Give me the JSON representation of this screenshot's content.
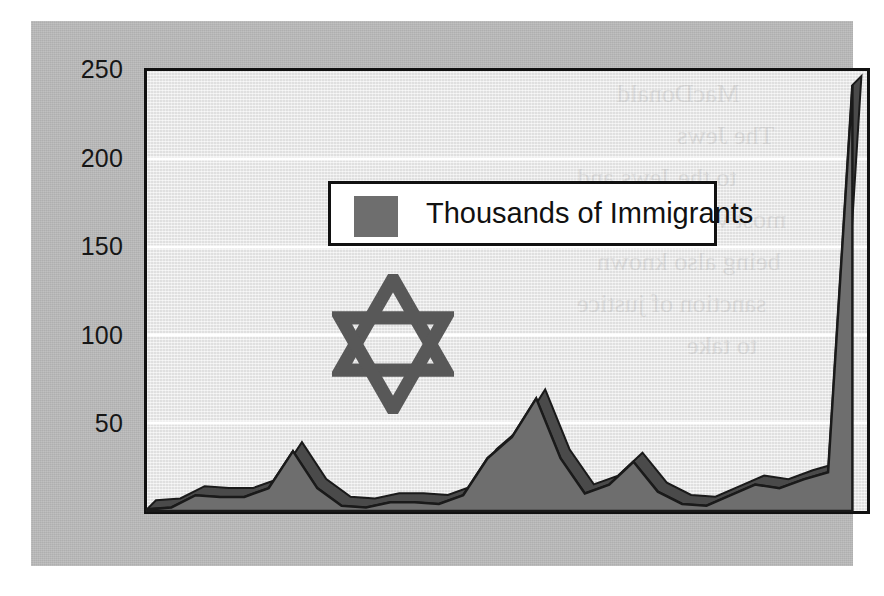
{
  "figure": {
    "background_color": "#ffffff",
    "panel_color": "#b9b9b9",
    "plot_background_color": "#e9e9e9",
    "axis_color": "#111111",
    "emblem": "star-of-david"
  },
  "legend": {
    "label": "Thousands of Immigrants",
    "swatch_color": "#6e6e6e",
    "position": "inside-top-left"
  },
  "axes": {
    "y_ticks": [
      "250",
      "200",
      "150",
      "100",
      "50"
    ],
    "x_ticks": [
      "1920",
      "1925",
      "1930",
      "1935",
      "1940",
      "1948"
    ]
  },
  "chart_data": {
    "type": "area",
    "title": "",
    "subtitle": "",
    "xlabel": "",
    "ylabel": "",
    "legend": [
      "Thousands of Immigrants"
    ],
    "legend_position": "inside-top-left",
    "grid": true,
    "gridlines_y": [
      50,
      100,
      150,
      200
    ],
    "xlim": [
      1919,
      1948.6
    ],
    "ylim": [
      0,
      250
    ],
    "y_ticks": [
      50,
      100,
      150,
      200,
      250
    ],
    "x_ticks": [
      1920,
      1925,
      1930,
      1935,
      1940,
      1948
    ],
    "series": [
      {
        "name": "Thousands of Immigrants",
        "color": "#6e6e6e",
        "shade_color": "#4a4a4a",
        "x": [
          1919,
          1920,
          1921,
          1922,
          1923,
          1924,
          1925,
          1926,
          1927,
          1928,
          1929,
          1930,
          1931,
          1932,
          1933,
          1934,
          1935,
          1936,
          1937,
          1938,
          1939,
          1940,
          1941,
          1942,
          1943,
          1944,
          1945,
          1946,
          1947,
          1948
        ],
        "values": [
          1,
          2,
          9,
          8,
          8,
          13,
          34,
          13,
          3,
          2,
          5,
          5,
          4,
          9,
          30,
          42,
          64,
          30,
          10,
          15,
          28,
          11,
          4,
          3,
          9,
          15,
          13,
          18,
          22,
          242
        ]
      }
    ],
    "annotations": [
      {
        "kind": "emblem",
        "name": "star-of-david",
        "x": 1922.6,
        "y": 130
      },
      {
        "kind": "peak",
        "label": "1925 peak",
        "x": 1925,
        "y": 34
      },
      {
        "kind": "peak",
        "label": "1935 peak",
        "x": 1935,
        "y": 64
      },
      {
        "kind": "peak",
        "label": "1948 spike",
        "x": 1948,
        "y": 242
      }
    ]
  },
  "y_label_positions": [
    {
      "text": "250",
      "top": 34
    },
    {
      "text": "200",
      "top": 123
    },
    {
      "text": "150",
      "top": 211
    },
    {
      "text": "100",
      "top": 300
    },
    {
      "text": "50",
      "top": 388
    }
  ],
  "x_label_positions": [
    {
      "text": "1920",
      "left": 106
    },
    {
      "text": "1925",
      "left": 228
    },
    {
      "text": "1930",
      "left": 350
    },
    {
      "text": "1935",
      "left": 472
    },
    {
      "text": "1940",
      "left": 594
    },
    {
      "text": "1948",
      "left": 777
    }
  ],
  "bleed_text": [
    {
      "text": "MacDonald",
      "left": 470,
      "top": 8
    },
    {
      "text": "The Jews",
      "left": 530,
      "top": 50
    },
    {
      "text": "to the Jews and",
      "left": 430,
      "top": 92
    },
    {
      "text": "most violent action",
      "left": 440,
      "top": 134
    },
    {
      "text": "being also known",
      "left": 450,
      "top": 176
    },
    {
      "text": "sanction of justice",
      "left": 430,
      "top": 218
    },
    {
      "text": "to take",
      "left": 540,
      "top": 260
    }
  ]
}
